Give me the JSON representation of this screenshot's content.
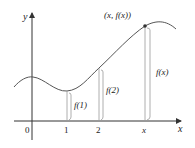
{
  "diagram": {
    "axes": {
      "x_label": "x",
      "y_label": "y",
      "origin_label": "0"
    },
    "ticks": [
      {
        "label": "1"
      },
      {
        "label": "2"
      },
      {
        "label": "x"
      }
    ],
    "point_label": "(x, f(x))",
    "segments": [
      {
        "label": "f(1)"
      },
      {
        "label": "f(2)"
      },
      {
        "label": "f(x)"
      }
    ],
    "colors": {
      "axis": "#333333",
      "curve": "#555555",
      "segment": "#888888",
      "text": "#222222"
    }
  }
}
